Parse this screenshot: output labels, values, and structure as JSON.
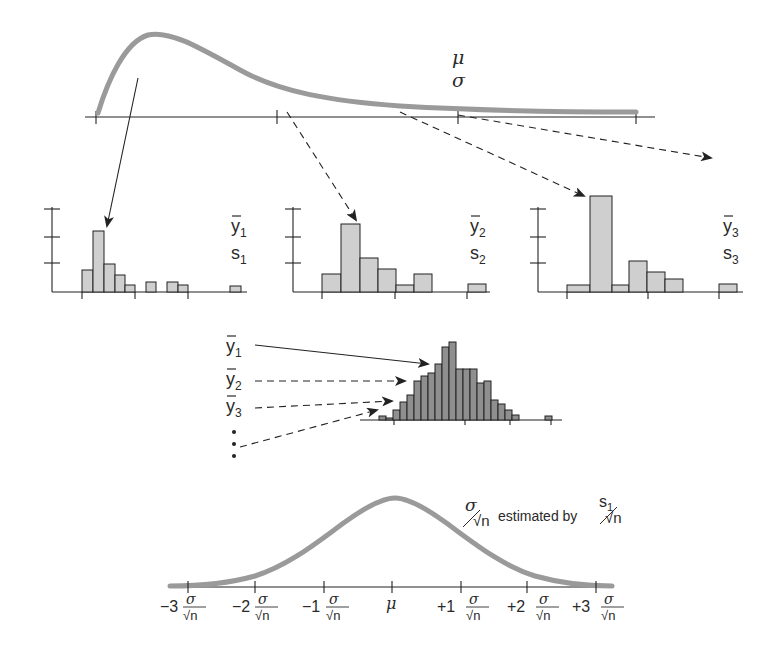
{
  "population": {
    "mean_label": "μ",
    "sd_label": "σ",
    "curve_color": "#9a9a9a"
  },
  "samples": [
    {
      "mean_label": "y",
      "mean_sub": "1",
      "sd_label": "s",
      "sd_sub": "1",
      "bars": [
        0.48,
        1.0,
        0.55,
        0.35,
        0.12,
        0,
        0.18,
        0,
        0.18,
        0.12,
        0,
        0,
        0,
        0.12
      ]
    },
    {
      "mean_label": "y",
      "mean_sub": "2",
      "sd_label": "s",
      "sd_sub": "2",
      "bars": [
        0.25,
        1.0,
        0.49,
        0.33,
        0.09,
        0.25,
        0,
        0,
        0.1
      ]
    },
    {
      "mean_label": "y",
      "mean_sub": "3",
      "sd_label": "s",
      "sd_sub": "3",
      "bars": [
        0.06,
        1.0,
        0.07,
        0.32,
        0.2,
        0.12,
        0,
        0,
        0.08
      ]
    }
  ],
  "sampling_distribution": {
    "labels": [
      {
        "text": "y",
        "sub": "1"
      },
      {
        "text": "y",
        "sub": "2"
      },
      {
        "text": "y",
        "sub": "3"
      }
    ],
    "ellipsis": "⋮",
    "bars": [
      0.06,
      0.03,
      0.13,
      0.24,
      0.32,
      0.5,
      0.56,
      0.6,
      0.71,
      0.94,
      1.0,
      0.65,
      0.65,
      0.65,
      0.48,
      0.5,
      0.26,
      0.2,
      0.12,
      0.05,
      0,
      0,
      0,
      0.05
    ]
  },
  "normal": {
    "annotation_numerator": "σ",
    "annotation_denominator": "√n",
    "annotation_text": "estimated by",
    "annotation_numerator2": "s",
    "annotation_sub2": "1",
    "annotation_denominator2": "√n",
    "ticks": [
      {
        "coef": "−3",
        "frac": true
      },
      {
        "coef": "−2",
        "frac": true
      },
      {
        "coef": "−1",
        "frac": true
      },
      {
        "coef": "μ",
        "frac": false
      },
      {
        "coef": "+1",
        "frac": true
      },
      {
        "coef": "+2",
        "frac": true
      },
      {
        "coef": "+3",
        "frac": true
      }
    ],
    "frac_num": "σ",
    "frac_den": "√n"
  }
}
